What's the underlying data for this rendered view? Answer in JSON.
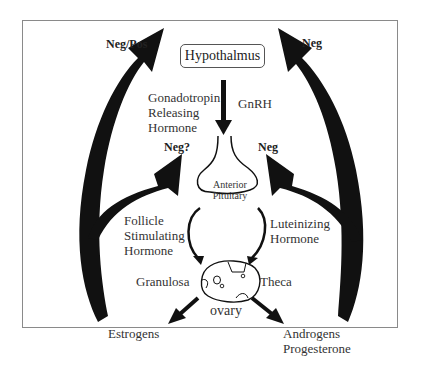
{
  "diagram": {
    "nodes": {
      "hypothalamus": "Hypothalmus",
      "anterior_pituitary_line1": "Anterior",
      "anterior_pituitary_line2": "Pituitary",
      "ovary": "ovary",
      "granulosa": "Granulosa",
      "theca": "Theca",
      "estrogens": "Estrogens",
      "androgens": "Androgens",
      "progesterone": "Progesterone"
    },
    "hormones": {
      "gnrh_full_line1": "Gonadotropin",
      "gnrh_full_line2": "Releasing",
      "gnrh_full_line3": "Hormone",
      "gnrh_abbr": "GnRH",
      "fsh_line1": "Follicle",
      "fsh_line2": "Stimulating",
      "fsh_line3": "Hormone",
      "lh_line1": "Luteinizing",
      "lh_line2": "Hormone"
    },
    "feedback": {
      "estrogens_to_hypothalamus": "Neg/Pos",
      "estrogens_to_pituitary": "Neg?",
      "androgens_to_hypothalamus": "Neg",
      "androgens_to_pituitary": "Neg"
    },
    "colors": {
      "arrow": "#111111",
      "frame": "#8a8a8a",
      "text": "#333333"
    }
  }
}
